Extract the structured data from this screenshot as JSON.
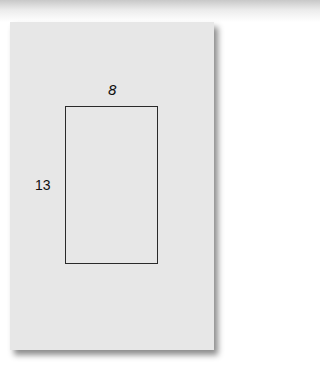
{
  "diagram": {
    "shape": "rectangle",
    "width_label": "8",
    "height_label": "13"
  }
}
